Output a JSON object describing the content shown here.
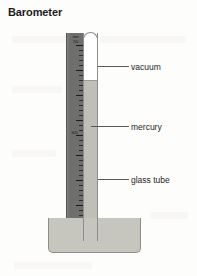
{
  "figure": {
    "title": "Barometer",
    "type": "mercury-barometer-diagram"
  },
  "scale": {
    "unit_label": "mm",
    "top_value": "700",
    "mid_value": "600",
    "tick_count": 38,
    "major_tick_every": 5
  },
  "callouts": [
    {
      "id": "vacuum",
      "label": "vacuum"
    },
    {
      "id": "mercury",
      "label": "mercury"
    },
    {
      "id": "glass_tube",
      "label": "glass tube"
    }
  ],
  "colors": {
    "background": "#fdfdfc",
    "scale_strip": "#6f6f6d",
    "mercury": "#bfbfb8",
    "vacuum": "#ffffff",
    "reservoir": "#c6c6bf",
    "outline": "#8d8d8a",
    "text": "#262625",
    "title": "#1c1c1c"
  }
}
